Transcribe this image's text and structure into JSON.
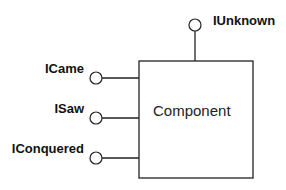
{
  "diagram": {
    "component": {
      "label": "Component",
      "box": {
        "x": 139,
        "y": 61,
        "width": 114,
        "height": 117
      }
    },
    "interfaces": [
      {
        "name": "IUnknown",
        "side": "top",
        "cx": 195,
        "cy": 25,
        "label_x": 213,
        "label_y": 25,
        "anchor": "start"
      },
      {
        "name": "ICame",
        "side": "left",
        "cx": 96,
        "cy": 78,
        "label_x": 84,
        "label_y": 73,
        "anchor": "end"
      },
      {
        "name": "ISaw",
        "side": "left",
        "cx": 96,
        "cy": 118,
        "label_x": 84,
        "label_y": 113,
        "anchor": "end"
      },
      {
        "name": "IConquered",
        "side": "left",
        "cx": 96,
        "cy": 158,
        "label_x": 84,
        "label_y": 153,
        "anchor": "end"
      }
    ],
    "colors": {
      "stroke": "#222222",
      "background": "#ffffff"
    }
  }
}
